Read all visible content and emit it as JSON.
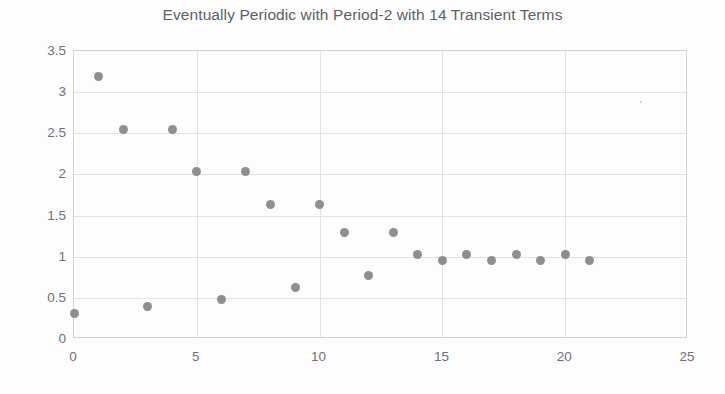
{
  "chart_data": {
    "type": "scatter",
    "title": "Eventually Periodic with Period-2 with 14 Transient Terms",
    "xlabel": "",
    "ylabel": "",
    "xlim": [
      0,
      25
    ],
    "ylim": [
      0,
      3.5
    ],
    "xticks": [
      "0",
      "5",
      "10",
      "15",
      "20",
      "25"
    ],
    "xtick_values": [
      0,
      5,
      10,
      15,
      20,
      25
    ],
    "yticks": [
      "0",
      "0.5",
      "1",
      "1.5",
      "2",
      "2.5",
      "3",
      "3.5"
    ],
    "ytick_values": [
      0,
      0.5,
      1,
      1.5,
      2,
      2.5,
      3,
      3.5
    ],
    "grid": "both",
    "legend": "none",
    "marker_color": "#808084",
    "gridline_color": "#e2e2e4",
    "axis_color": "#d2d2d4",
    "x": [
      0,
      1,
      2,
      3,
      4,
      5,
      6,
      7,
      8,
      9,
      10,
      11,
      12,
      13,
      14,
      15,
      16,
      17,
      18,
      19,
      20,
      21
    ],
    "values": [
      0.31,
      3.19,
      2.55,
      0.39,
      2.55,
      2.03,
      0.48,
      2.03,
      1.63,
      0.62,
      1.63,
      1.3,
      0.77,
      1.3,
      1.03,
      0.95,
      1.03,
      0.95,
      1.03,
      0.95,
      1.03,
      0.95
    ],
    "annotations": []
  }
}
